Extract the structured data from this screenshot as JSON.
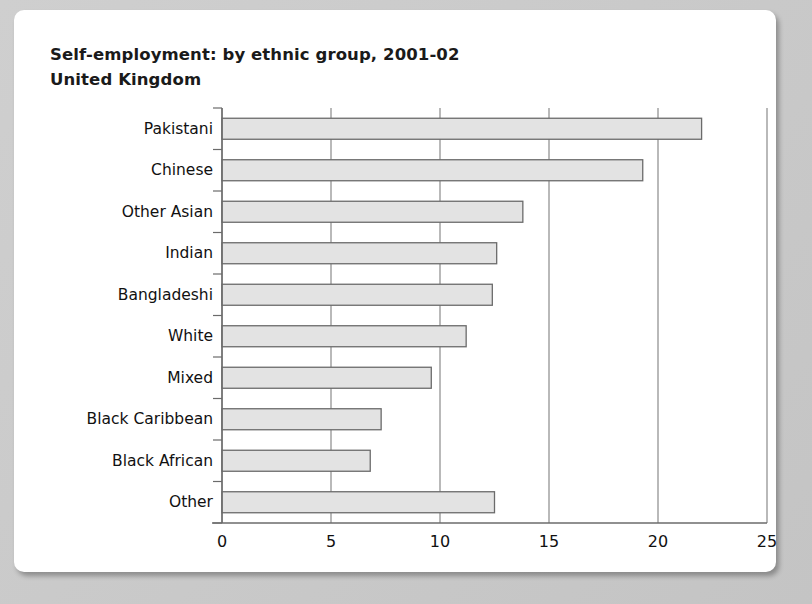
{
  "card": {
    "title_line1": "Self-employment: by ethnic group, 2001-02",
    "title_line2": "United Kingdom"
  },
  "chart_data": {
    "type": "bar",
    "orientation": "horizontal",
    "title": "Self-employment: by ethnic group, 2001-02",
    "subtitle": "United Kingdom",
    "xlabel": "",
    "ylabel": "",
    "xlim": [
      0,
      25
    ],
    "xticks": [
      0,
      5,
      10,
      15,
      20,
      25
    ],
    "xtick_labels": [
      "0",
      "5",
      "10",
      "15",
      "20",
      "25"
    ],
    "grid": "vertical",
    "legend": "none",
    "bar_fill": "#e3e3e3",
    "bar_edge": "#6b6b6b",
    "categories": [
      "Pakistani",
      "Chinese",
      "Other Asian",
      "Indian",
      "Bangladeshi",
      "White",
      "Mixed",
      "Black Caribbean",
      "Black African",
      "Other"
    ],
    "values": [
      22.0,
      19.3,
      13.8,
      12.6,
      12.4,
      11.2,
      9.6,
      7.3,
      6.8,
      12.5
    ]
  }
}
